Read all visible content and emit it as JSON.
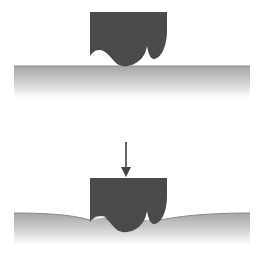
{
  "diagram": {
    "colors": {
      "block": "#4a4a4a",
      "surface_top": "#9a9a9a",
      "surface_fade": "#ffffff",
      "arrow": "#444444",
      "background": "#ffffff"
    },
    "panels": [
      {
        "id": "before-load",
        "label": "",
        "surface": "flat",
        "force_arrow": false
      },
      {
        "id": "under-load",
        "label": "",
        "surface": "deformed",
        "force_arrow": true,
        "arrow_direction": "down"
      }
    ]
  }
}
